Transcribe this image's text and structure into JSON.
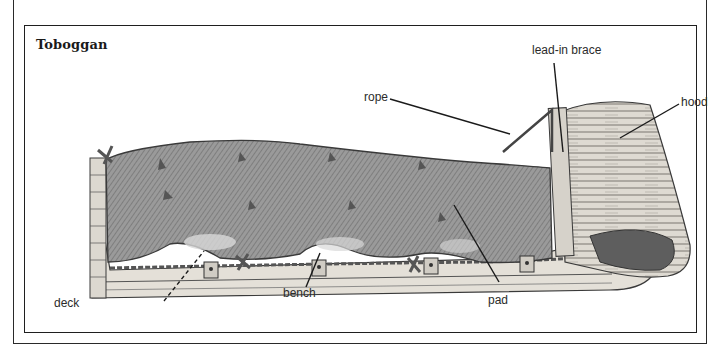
{
  "figure": {
    "title": "Toboggan",
    "labels": {
      "lead_in_brace": "lead-in brace",
      "rope": "rope",
      "hood": "hood",
      "deck": "deck",
      "bench": "bench",
      "pad": "pad"
    }
  },
  "colors": {
    "frame": "#222222",
    "pad_shade": "#8a8a8a",
    "wood": "#d8d4cc",
    "text": "#2b2b2b"
  }
}
